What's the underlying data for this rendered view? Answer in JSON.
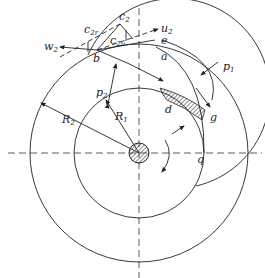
{
  "diagram": {
    "type": "pump impeller velocity / pressure schematic",
    "labels": {
      "c2": "c",
      "c2_sub": "2",
      "c2r": "c",
      "c2r_sub": "2r",
      "c2u": "c",
      "c2u_sub": "2u",
      "u2": "u",
      "u2_sub": "2",
      "w2": "w",
      "w2_sub": "2",
      "e": "e",
      "a": "a",
      "b": "b",
      "p1": "p",
      "p1_sub": "1",
      "p2": "p",
      "p2_sub": "2",
      "d": "d",
      "g": "g",
      "q": "q",
      "R1": "R",
      "R1_sub": "1",
      "R2": "R",
      "R2_sub": "2"
    },
    "colors": {
      "line": "#222222",
      "background": "#ffffff"
    }
  }
}
